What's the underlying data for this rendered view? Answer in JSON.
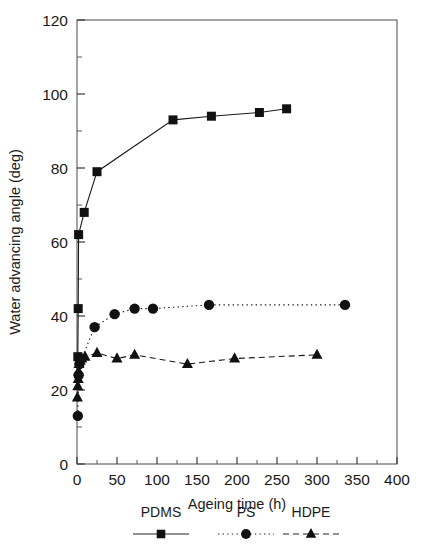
{
  "chart_data": {
    "type": "line",
    "title": "",
    "xlabel": "Ageing time (h)",
    "ylabel": "Water advancing angle (deg)",
    "xlim": [
      0,
      400
    ],
    "ylim": [
      0,
      120
    ],
    "xticks": [
      0,
      50,
      100,
      150,
      200,
      250,
      300,
      350,
      400
    ],
    "yticks": [
      0,
      20,
      40,
      60,
      80,
      100,
      120
    ],
    "x_minor_step": 25,
    "y_minor_step": 10,
    "grid": false,
    "legend_position": "below",
    "series": [
      {
        "name": "PDMS",
        "marker": "square",
        "line": "solid",
        "color": "#1a1a1a",
        "points": [
          {
            "x": 1,
            "y": 29
          },
          {
            "x": 1.5,
            "y": 42
          },
          {
            "x": 2,
            "y": 62
          },
          {
            "x": 9,
            "y": 68
          },
          {
            "x": 25,
            "y": 79
          },
          {
            "x": 120,
            "y": 93
          },
          {
            "x": 168,
            "y": 94
          },
          {
            "x": 228,
            "y": 95
          },
          {
            "x": 262,
            "y": 96
          }
        ]
      },
      {
        "name": "PS",
        "marker": "circle",
        "line": "dotted",
        "color": "#1a1a1a",
        "points": [
          {
            "x": 1,
            "y": 13
          },
          {
            "x": 2,
            "y": 24
          },
          {
            "x": 3,
            "y": 27
          },
          {
            "x": 22,
            "y": 37
          },
          {
            "x": 47,
            "y": 40.5
          },
          {
            "x": 72,
            "y": 42
          },
          {
            "x": 95,
            "y": 42
          },
          {
            "x": 165,
            "y": 43
          },
          {
            "x": 335,
            "y": 43
          }
        ]
      },
      {
        "name": "HDPE",
        "marker": "triangle",
        "line": "dashed",
        "color": "#1a1a1a",
        "points": [
          {
            "x": 0.5,
            "y": 18
          },
          {
            "x": 1,
            "y": 21
          },
          {
            "x": 1.5,
            "y": 23
          },
          {
            "x": 2,
            "y": 25
          },
          {
            "x": 2.5,
            "y": 27
          },
          {
            "x": 4,
            "y": 28
          },
          {
            "x": 6,
            "y": 28.5
          },
          {
            "x": 10,
            "y": 29
          },
          {
            "x": 25,
            "y": 30
          },
          {
            "x": 50,
            "y": 28.5
          },
          {
            "x": 72,
            "y": 29.5
          },
          {
            "x": 138,
            "y": 27
          },
          {
            "x": 197,
            "y": 28.5
          },
          {
            "x": 300,
            "y": 29.5
          }
        ]
      }
    ]
  },
  "legend": {
    "items": [
      {
        "label": "PDMS",
        "marker": "square",
        "line": "solid"
      },
      {
        "label": "PS",
        "marker": "circle",
        "line": "dotted"
      },
      {
        "label": "HDPE",
        "marker": "triangle",
        "line": "dashed"
      }
    ]
  },
  "axis_text": {
    "x_title": "Ageing time (h)",
    "y_title": "Water advancing angle (deg)",
    "x_tick_labels": [
      "0",
      "50",
      "100",
      "150",
      "200",
      "250",
      "300",
      "350",
      "400"
    ],
    "y_tick_labels": [
      "0",
      "20",
      "40",
      "60",
      "80",
      "100",
      "120"
    ]
  }
}
